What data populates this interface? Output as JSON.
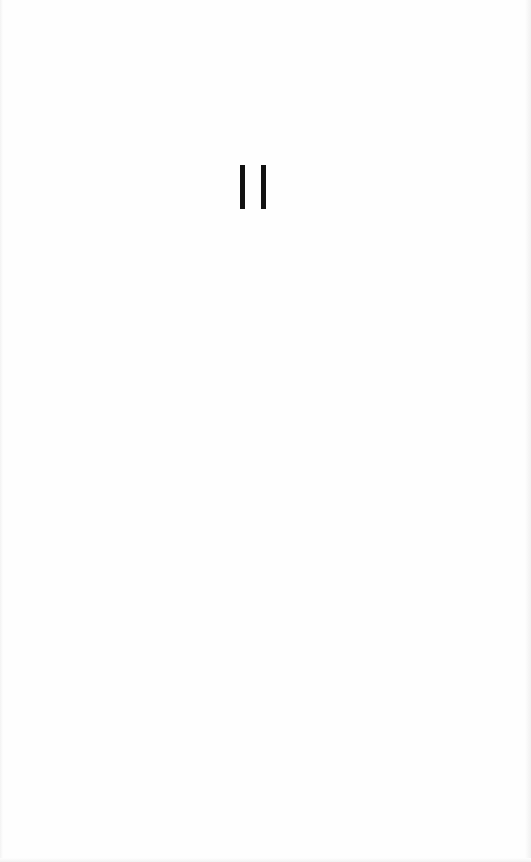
{
  "screen": {
    "background_color": "#ffffff"
  },
  "pause_indicator": {
    "icon": "pause-icon",
    "label": "Paused",
    "color": "#111111"
  }
}
